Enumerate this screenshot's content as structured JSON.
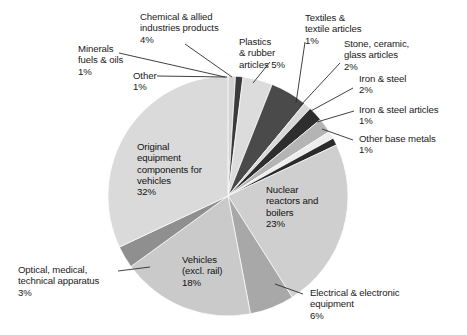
{
  "chart_data": {
    "type": "pie",
    "title": "",
    "subtitle": "",
    "xlabel": "",
    "ylabel": "",
    "legend_position": "none",
    "grid": false,
    "units": "percent",
    "total": 100,
    "start_angle_deg": 0,
    "direction": "clockwise",
    "center": {
      "x": 228,
      "y": 196
    },
    "radius": 120,
    "categories": [
      "Minerals fuels & oils",
      "Other",
      "Chemical & allied industries products",
      "Plastics & rubber articles",
      "Textiles & textile articles",
      "Stone, ceramic, glass articles",
      "Iron & steel",
      "Iron & steel articles",
      "Other base metals",
      "Nuclear reactors and boilers",
      "Electrical & electronic equipment",
      "Vehicles (excl. rail)",
      "Optical, medical, technical apparatus",
      "Original equipment components for vehicles"
    ],
    "values": [
      1,
      1,
      4,
      5,
      1,
      2,
      2,
      1,
      1,
      23,
      6,
      18,
      3,
      32
    ],
    "slices": [
      {
        "name": "Minerals fuels & oils",
        "value": 1,
        "label": "Minerals\nfuels & oils\n1%",
        "color": "#d3d3d3",
        "start_deg": 0,
        "end_deg": 3.6,
        "placement": "leader"
      },
      {
        "name": "Other",
        "value": 1,
        "label": "Other\n1%",
        "color": "#3a3a3a",
        "start_deg": 3.6,
        "end_deg": 7.2,
        "placement": "leader"
      },
      {
        "name": "Chemical & allied industries products",
        "value": 4,
        "label": "Chemical & allied\nindustries products\n4%",
        "color": "#dcdcdc",
        "start_deg": 7.2,
        "end_deg": 21.6,
        "placement": "leader"
      },
      {
        "name": "Plastics & rubber articles",
        "value": 5,
        "label": "Plastics\n& rubber\narticles 5%",
        "color": "#4a4a4a",
        "start_deg": 21.6,
        "end_deg": 39.6,
        "placement": "leader"
      },
      {
        "name": "Textiles & textile articles",
        "value": 1,
        "label": "Textiles &\ntextile articles\n1%",
        "color": "#d8d8d8",
        "start_deg": 39.6,
        "end_deg": 43.2,
        "placement": "leader"
      },
      {
        "name": "Stone, ceramic, glass articles",
        "value": 2,
        "label": "Stone, ceramic,\nglass articles\n2%",
        "color": "#2e2e2e",
        "start_deg": 43.2,
        "end_deg": 50.4,
        "placement": "leader"
      },
      {
        "name": "Iron & steel",
        "value": 2,
        "label": "Iron & steel\n2%",
        "color": "#b4b4b4",
        "start_deg": 50.4,
        "end_deg": 57.6,
        "placement": "leader"
      },
      {
        "name": "Iron & steel articles",
        "value": 1,
        "label": "Iron & steel articles\n1%",
        "color": "#ededed",
        "start_deg": 57.6,
        "end_deg": 61.2,
        "placement": "leader"
      },
      {
        "name": "Other base metals",
        "value": 1,
        "label": "Other base metals\n1%",
        "color": "#2b2b2b",
        "start_deg": 61.2,
        "end_deg": 64.8,
        "placement": "leader"
      },
      {
        "name": "Nuclear reactors and boilers",
        "value": 23,
        "label": "Nuclear\nreactors and\nboilers\n23%",
        "color": "#cfcfcf",
        "start_deg": 64.8,
        "end_deg": 147.6,
        "placement": "inside"
      },
      {
        "name": "Electrical & electronic equipment",
        "value": 6,
        "label": "Electrical & electronic\nequipment\n6%",
        "color": "#a8a8a8",
        "start_deg": 147.6,
        "end_deg": 169.2,
        "placement": "leader"
      },
      {
        "name": "Vehicles (excl. rail)",
        "value": 18,
        "label": "Vehicles\n(excl. rail)\n18%",
        "color": "#cacaca",
        "start_deg": 169.2,
        "end_deg": 234.0,
        "placement": "inside"
      },
      {
        "name": "Optical, medical, technical apparatus",
        "value": 3,
        "label": "Optical, medical,\ntechnical apparatus\n3%",
        "color": "#8f8f8f",
        "start_deg": 234.0,
        "end_deg": 244.8,
        "placement": "leader"
      },
      {
        "name": "Original equipment components for vehicles",
        "value": 32,
        "label": "Original\nequipment\ncomponents for\nvehicles\n32%",
        "color": "#dadada",
        "start_deg": 244.8,
        "end_deg": 360.0,
        "placement": "inside"
      }
    ]
  },
  "labels": {
    "minerals_fuels_oils": "Minerals\nfuels & oils\n1%",
    "other": "Other\n1%",
    "chemical_allied": "Chemical & allied\nindustries products\n4%",
    "plastics_rubber": "Plastics\n& rubber\narticles 5%",
    "textiles": "Textiles &\ntextile articles\n1%",
    "stone_ceramic_glass": "Stone, ceramic,\nglass articles\n2%",
    "iron_steel": "Iron & steel\n2%",
    "iron_steel_articles": "Iron & steel articles\n1%",
    "other_base_metals": "Other base metals\n1%",
    "nuclear_reactors": "Nuclear\nreactors and\nboilers\n23%",
    "electrical_electronic": "Electrical & electronic\nequipment\n6%",
    "vehicles_excl_rail": "Vehicles\n(excl. rail)\n18%",
    "optical_medical": "Optical, medical,\ntechnical apparatus\n3%",
    "original_equipment": "Original\nequipment\ncomponents for\nvehicles\n32%"
  },
  "colors": {
    "background": "#ffffff",
    "text": "#1a1a1a",
    "leader_line": "#2b2b2b",
    "slice_light": "#dadada",
    "slice_mid": "#a8a8a8",
    "slice_dark": "#3a3a3a"
  }
}
